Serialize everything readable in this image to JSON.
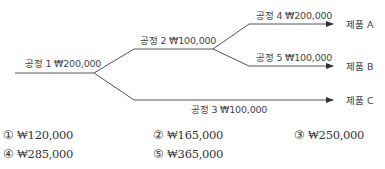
{
  "diagram": {
    "processes": [
      {
        "id": "p1",
        "label": "공정 1 ₩200,000"
      },
      {
        "id": "p2",
        "label": "공정 2 ₩100,000"
      },
      {
        "id": "p3",
        "label": "공정 3 ₩100,000"
      },
      {
        "id": "p4",
        "label": "공정 4 ₩200,000"
      },
      {
        "id": "p5",
        "label": "공정 5 ₩100,000"
      }
    ],
    "products": [
      {
        "id": "A",
        "label": "제품 A"
      },
      {
        "id": "B",
        "label": "제품 B"
      },
      {
        "id": "C",
        "label": "제품 C"
      }
    ],
    "flow": [
      {
        "from": "p1",
        "to": "p2"
      },
      {
        "from": "p1",
        "to": "p3"
      },
      {
        "from": "p2",
        "to": "p4"
      },
      {
        "from": "p2",
        "to": "p5"
      },
      {
        "from": "p4",
        "to": "A"
      },
      {
        "from": "p5",
        "to": "B"
      },
      {
        "from": "p3",
        "to": "C"
      }
    ],
    "line_color": "#555555"
  },
  "choices": [
    {
      "num": "①",
      "value": "₩120,000"
    },
    {
      "num": "②",
      "value": "₩165,000"
    },
    {
      "num": "③",
      "value": "₩250,000"
    },
    {
      "num": "④",
      "value": "₩285,000"
    },
    {
      "num": "⑤",
      "value": "₩365,000"
    }
  ]
}
